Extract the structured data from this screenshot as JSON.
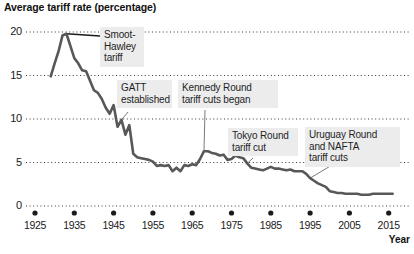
{
  "chart_data": {
    "type": "line",
    "title": "Average tariff rate (percentage)",
    "xlabel": "Year",
    "ylabel": "",
    "xlim": [
      1925,
      2016
    ],
    "ylim": [
      0,
      20
    ],
    "grid": true,
    "legend": null,
    "line_color": "#58585a",
    "xticks": [
      "1925",
      "1935",
      "1945",
      "1955",
      "1965",
      "1975",
      "1985",
      "1995",
      "2005",
      "2015"
    ],
    "xtick_values": [
      1925,
      1935,
      1945,
      1955,
      1965,
      1975,
      1985,
      1995,
      2005,
      2015
    ],
    "yticks": [
      "0",
      "5",
      "10",
      "15",
      "20"
    ],
    "ytick_values": [
      0,
      5,
      10,
      15,
      20
    ],
    "x": [
      1929,
      1930,
      1931,
      1932,
      1933,
      1934,
      1935,
      1936,
      1937,
      1938,
      1939,
      1940,
      1941,
      1942,
      1943,
      1944,
      1945,
      1946,
      1947,
      1948,
      1949,
      1950,
      1951,
      1952,
      1953,
      1954,
      1955,
      1956,
      1957,
      1958,
      1959,
      1960,
      1961,
      1962,
      1963,
      1964,
      1965,
      1966,
      1967,
      1968,
      1969,
      1970,
      1971,
      1972,
      1973,
      1974,
      1975,
      1976,
      1977,
      1978,
      1979,
      1980,
      1981,
      1982,
      1983,
      1984,
      1985,
      1986,
      1987,
      1988,
      1989,
      1990,
      1991,
      1992,
      1993,
      1994,
      1995,
      1996,
      1997,
      1998,
      1999,
      2000,
      2001,
      2002,
      2003,
      2004,
      2005,
      2006,
      2007,
      2008,
      2009,
      2010,
      2011,
      2012,
      2013,
      2014,
      2015,
      2016
    ],
    "values": [
      14.9,
      16.4,
      17.8,
      19.6,
      19.8,
      18.4,
      17.0,
      16.4,
      15.6,
      15.5,
      14.4,
      13.3,
      13.0,
      12.3,
      11.3,
      10.6,
      11.6,
      9.1,
      9.9,
      8.2,
      9.3,
      6.0,
      5.6,
      5.5,
      5.4,
      5.3,
      5.1,
      4.6,
      4.7,
      4.6,
      4.7,
      4.0,
      4.4,
      4.0,
      4.7,
      4.6,
      4.8,
      4.7,
      5.4,
      6.3,
      6.3,
      6.1,
      6.0,
      5.8,
      5.9,
      5.3,
      5.4,
      5.8,
      5.6,
      5.5,
      4.9,
      4.4,
      4.3,
      4.2,
      4.1,
      4.3,
      4.5,
      4.3,
      4.3,
      4.2,
      4.1,
      4.2,
      4.0,
      4.0,
      4.0,
      3.7,
      3.2,
      2.9,
      2.6,
      2.4,
      2.2,
      1.7,
      1.6,
      1.5,
      1.5,
      1.4,
      1.4,
      1.4,
      1.4,
      1.3,
      1.3,
      1.3,
      1.4,
      1.4,
      1.4,
      1.4,
      1.4,
      1.4
    ],
    "annotations": [
      {
        "id": "smoot-hawley",
        "lines": [
          "Smoot-",
          "Hawley",
          "tariff"
        ],
        "year": 1933,
        "value": 19.8
      },
      {
        "id": "gatt",
        "lines": [
          "GATT",
          "established"
        ],
        "year": 1947,
        "value": 9.9
      },
      {
        "id": "kennedy-round",
        "lines": [
          "Kennedy Round",
          "tariff cuts began"
        ],
        "year": 1968,
        "value": 6.3
      },
      {
        "id": "tokyo-round",
        "lines": [
          "Tokyo Round",
          "tariff cut"
        ],
        "year": 1979,
        "value": 4.9
      },
      {
        "id": "uruguay-nafta",
        "lines": [
          "Uruguay Round",
          "and NAFTA",
          "tariff cuts"
        ],
        "year": 1995,
        "value": 3.2
      }
    ]
  }
}
